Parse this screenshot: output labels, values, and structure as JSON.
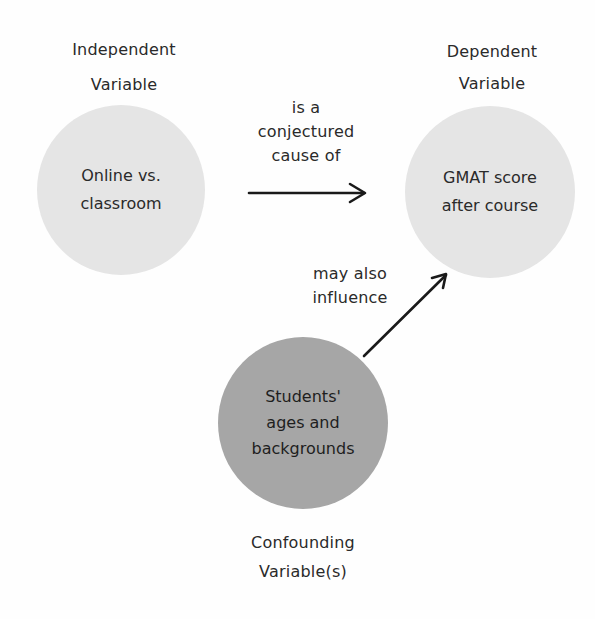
{
  "diagram": {
    "independent": {
      "heading": [
        "Independent",
        "Variable"
      ],
      "node_text": [
        "Online vs.",
        "classroom"
      ],
      "fill": "#e5e5e5"
    },
    "dependent": {
      "heading": [
        "Dependent",
        "Variable"
      ],
      "node_text": [
        "GMAT score",
        "after course"
      ],
      "fill": "#e5e5e5"
    },
    "confounding": {
      "heading": [
        "Confounding",
        "Variable(s)"
      ],
      "node_text": [
        "Students'",
        "ages and",
        "backgrounds"
      ],
      "fill": "#a6a6a6"
    },
    "edges": [
      {
        "from": "independent",
        "to": "dependent",
        "label": [
          "is a",
          "conjectured",
          "cause of"
        ]
      },
      {
        "from": "confounding",
        "to": "dependent",
        "label": [
          "may also",
          "influence"
        ]
      }
    ]
  }
}
